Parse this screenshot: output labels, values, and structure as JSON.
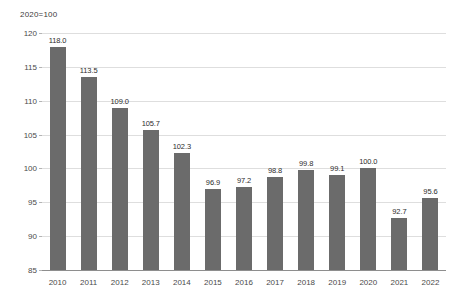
{
  "chart_data": {
    "type": "bar",
    "title": "",
    "subtitle": "2020=100",
    "xlabel": "",
    "ylabel": "",
    "ylim": [
      85,
      120
    ],
    "ytick_step": 5,
    "yticks": [
      "85",
      "90",
      "95",
      "100",
      "105",
      "110",
      "115",
      "120"
    ],
    "grid": true,
    "legend": false,
    "bar_color": "#6b6b6b",
    "gridline_color": "#dedede",
    "axis_color": "#8e8e8e",
    "label_color": "#2d2d2d",
    "categories": [
      "2010",
      "2011",
      "2012",
      "2013",
      "2014",
      "2015",
      "2016",
      "2017",
      "2018",
      "2019",
      "2020",
      "2021",
      "2022"
    ],
    "values": [
      118.0,
      113.5,
      109.0,
      105.7,
      102.3,
      96.9,
      97.2,
      98.8,
      99.8,
      99.1,
      100.0,
      92.7,
      95.6
    ],
    "value_labels": [
      "118.0",
      "113.5",
      "109.0",
      "105.7",
      "102.3",
      "96.9",
      "97.2",
      "98.8",
      "99.8",
      "99.1",
      "100.0",
      "92.7",
      "95.6"
    ]
  }
}
